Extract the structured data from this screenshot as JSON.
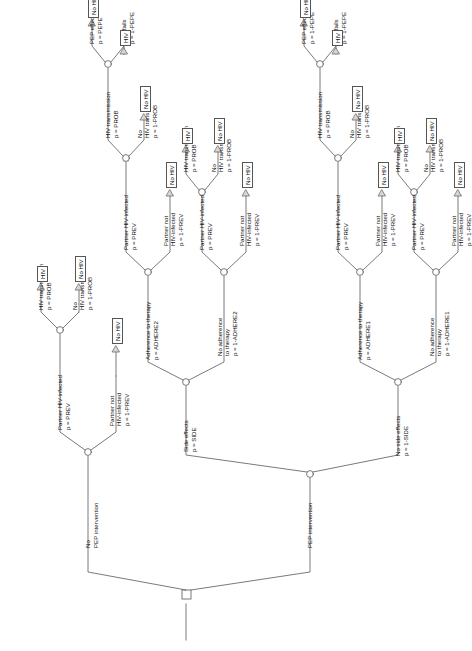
{
  "diagram": {
    "orientation": "rotated-90-ccw",
    "root_shape": "square",
    "chance_shape": "circle",
    "terminal_shape": "triangle",
    "stroke_color": "#666666",
    "text_color": "#111111"
  },
  "labels": {
    "no_pep_intervention_l1": "No",
    "no_pep_intervention_l2": "PEP intervention",
    "pep_intervention": "PEP intervention",
    "side_effects": "Side effects",
    "side_effects_p": "p = SIDE",
    "no_side_effects": "No side effects",
    "no_side_effects_p": "p = 1-SIDE",
    "adherence_to_therapy": "Adherence to therapy",
    "adhere2_p": "p = ADHERE2",
    "no_adherence_l1": "No adherence",
    "no_adherence_l2": "to therapy",
    "not_adhere2_p": "p = 1-ADHERE2",
    "adhere1_p": "p = ADHERE1",
    "not_adhere1_p": "p = 1-ADHERE1",
    "partner_hiv_infected": "Partner HIV-infected",
    "prev_p": "p = PREV",
    "partner_not_l1": "Partner not",
    "partner_not_l2": "HIV-infected",
    "not_prev_p": "p = 1-PREV",
    "hiv_transmission": "HIV transmission",
    "prob_p": "p = PROB",
    "no_hiv_transmission_l1": "No",
    "no_hiv_transmission_l2": "HIV transmission",
    "not_prob_p": "p = 1-PROB",
    "pep_effective": "PEP effective",
    "pepe_p": "p = PEPE",
    "pepe_inv_p": "p = 1-PEPE",
    "pep_fails": "PEP fails",
    "leaf_hiv": "HIV",
    "leaf_no_hiv": "No HIV"
  },
  "tree": {
    "root": {
      "name": "root-decision-node",
      "branches": [
        "No PEP intervention",
        "PEP intervention"
      ]
    },
    "no_pep_branch": {
      "partner_hiv_infected": {
        "p": "p = PREV",
        "hiv_transmission": {
          "p": "p = PROB",
          "leaf": "HIV"
        },
        "no_hiv_transmission": {
          "p": "p = 1-PROB",
          "leaf": "No HIV"
        }
      },
      "partner_not_hiv_infected": {
        "p": "p = 1-PREV",
        "leaf": "No HIV"
      }
    },
    "pep_branch": {
      "side_effects": {
        "p": "p = SIDE",
        "adherence_to_therapy": {
          "p": "p = ADHERE2",
          "partner_hiv_infected": {
            "p": "p = PREV",
            "hiv_transmission": {
              "p": "p = PROB",
              "pep_effective": {
                "p": "p = PEPE",
                "leaf": "No HIV"
              },
              "pep_fails": {
                "p": "p = 1-PEPE",
                "leaf": "HIV"
              }
            },
            "no_hiv_transmission": {
              "p": "p = 1-PROB",
              "leaf": "No HIV"
            }
          },
          "partner_not_hiv_infected": {
            "p": "p = 1-PREV",
            "leaf": "No HIV"
          }
        },
        "no_adherence_to_therapy": {
          "p": "p = 1-ADHERE2",
          "partner_hiv_infected": {
            "p": "p = PREV",
            "hiv_transmission": {
              "p": "p = PROB",
              "leaf": "HIV"
            },
            "no_hiv_transmission": {
              "p": "p = 1-PROB",
              "leaf": "No HIV"
            }
          },
          "partner_not_hiv_infected": {
            "p": "p = 1-PREV",
            "leaf": "No HIV"
          }
        }
      },
      "no_side_effects": {
        "p": "p = 1-SIDE",
        "adherence_to_therapy": {
          "p": "p = ADHERE1",
          "partner_hiv_infected": {
            "p": "p = PREV",
            "hiv_transmission": {
              "p": "p = PROB",
              "pep_effective": {
                "p": "p = 1-PEPE",
                "leaf": "No HIV"
              },
              "pep_fails": {
                "p": "p = 1-PEPE",
                "leaf": "HIV"
              }
            },
            "no_hiv_transmission": {
              "p": "p = 1-PROB",
              "leaf": "No HIV"
            }
          },
          "partner_not_hiv_infected": {
            "p": "p = 1-PREV",
            "leaf": "No HIV"
          }
        },
        "no_adherence_to_therapy": {
          "p": "p = 1-ADHERE1",
          "partner_hiv_infected": {
            "p": "p = PREV",
            "hiv_transmission": {
              "p": "p = PROB",
              "leaf": "HIV"
            },
            "no_hiv_transmission": {
              "p": "p = 1-PROB",
              "leaf": "No HIV"
            }
          },
          "partner_not_hiv_infected": {
            "p": "p = 1-PREV",
            "leaf": "No HIV"
          }
        }
      }
    }
  }
}
